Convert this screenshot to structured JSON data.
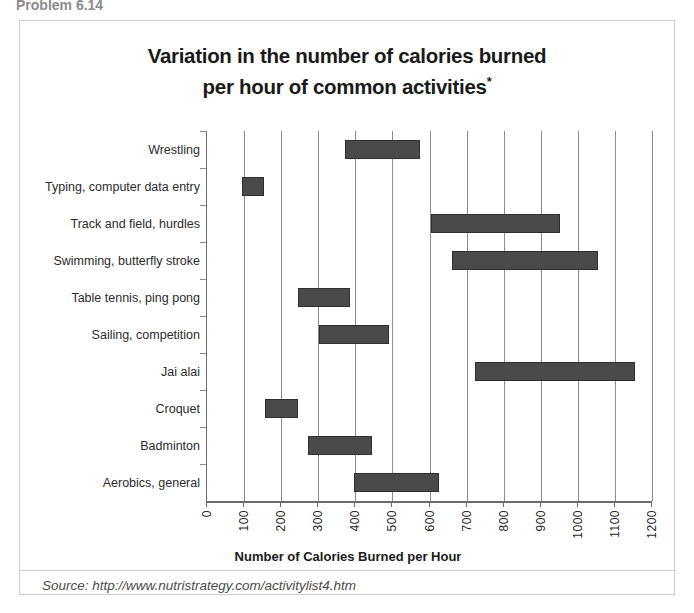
{
  "page": {
    "cut_off_header": "Problem 6.14"
  },
  "figure": {
    "title_line1": "Variation in the number of calories burned",
    "title_line2": "per hour of common activities",
    "title_asterisk": "*",
    "source": "Source: http://www.nutristrategy.com/activitylist4.htm"
  },
  "chart_data": {
    "type": "bar",
    "orientation": "horizontal",
    "subtype": "range-bar",
    "title": "Variation in the number of calories burned per hour of common activities*",
    "xlabel": "Number of Calories Burned per Hour",
    "ylabel": "",
    "xlim": [
      0,
      1200
    ],
    "xticks": [
      0,
      100,
      200,
      300,
      400,
      500,
      600,
      700,
      800,
      900,
      1000,
      1100,
      1200
    ],
    "xtick_labels": [
      "0",
      "100",
      "200",
      "300",
      "400",
      "500",
      "600",
      "700",
      "800",
      "900",
      "1000",
      "1100",
      "1200"
    ],
    "grid": true,
    "grid_axis": "x",
    "legend": null,
    "bar_color": "#4a4a4a",
    "bar_edge_color": "#2f2f2f",
    "categories": [
      "Wrestling",
      "Typing, computer data entry",
      "Track and field, hurdles",
      "Swimming, butterfly stroke",
      "Table tennis, ping pong",
      "Sailing, competition",
      "Jai alai",
      "Croquet",
      "Badminton",
      "Aerobics, general"
    ],
    "ranges": [
      {
        "label": "Wrestling",
        "low": 372,
        "high": 574
      },
      {
        "label": "Typing, computer data entry",
        "low": 95,
        "high": 155
      },
      {
        "label": "Track and field, hurdles",
        "low": 603,
        "high": 952
      },
      {
        "label": "Swimming, butterfly stroke",
        "low": 660,
        "high": 1054
      },
      {
        "label": "Table tennis, ping pong",
        "low": 245,
        "high": 385
      },
      {
        "label": "Sailing, competition",
        "low": 302,
        "high": 490
      },
      {
        "label": "Jai alai",
        "low": 722,
        "high": 1153
      },
      {
        "label": "Croquet",
        "low": 156,
        "high": 245
      },
      {
        "label": "Badminton",
        "low": 272,
        "high": 445
      },
      {
        "label": "Aerobics, general",
        "low": 396,
        "high": 625
      }
    ]
  }
}
